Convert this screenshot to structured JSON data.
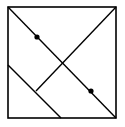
{
  "figure": {
    "description": "Square with diagonal lines and two marked points",
    "stroke_color": "#000000",
    "background_color": "#ffffff",
    "square": {
      "x1": 8,
      "y1": 7,
      "x2": 116,
      "y2": 118
    },
    "lines": [
      {
        "name": "main-diagonal",
        "x1": 8,
        "y1": 7,
        "x2": 116,
        "y2": 118
      },
      {
        "name": "anti-diagonal-segment",
        "x1": 116,
        "y1": 7,
        "x2": 36,
        "y2": 91
      },
      {
        "name": "parallel-segment",
        "x1": 8,
        "y1": 65,
        "x2": 61,
        "y2": 118
      }
    ],
    "points": [
      {
        "name": "point-upper",
        "cx": 37,
        "cy": 37,
        "r": 2.6
      },
      {
        "name": "point-lower",
        "cx": 91,
        "cy": 91,
        "r": 2.6
      }
    ]
  }
}
